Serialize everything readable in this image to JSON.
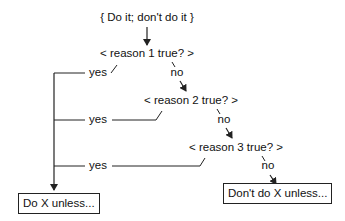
{
  "diagram": {
    "root": {
      "label": "{ Do it; don't do it }"
    },
    "decisions": [
      {
        "label": "< reason 1 true? >",
        "yes_label": "yes",
        "no_label": "no"
      },
      {
        "label": "< reason 2 true? >",
        "yes_label": "yes",
        "no_label": "no"
      },
      {
        "label": "< reason 3 true? >",
        "yes_label": "yes",
        "no_label": "no"
      }
    ],
    "outcomes": {
      "yes": {
        "label": "Do X unless..."
      },
      "no": {
        "label": "Don't do X unless..."
      }
    },
    "colors": {
      "line": "#222222",
      "text": "#111111",
      "background": "#ffffff"
    }
  }
}
